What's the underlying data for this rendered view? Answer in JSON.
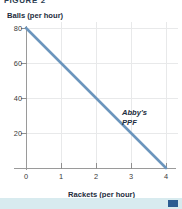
{
  "figure": {
    "caption": "FIGURE 2"
  },
  "axes": {
    "y_title": "Balls (per hour)",
    "x_title": "Rackets (per hour)"
  },
  "annotation": {
    "line1": "Abby's",
    "line2": "PPF"
  },
  "colors": {
    "ppf_line": "#6b95bd",
    "axis": "#9a9a9a",
    "gridline": "#e8e9ea",
    "text": "#1d2d40",
    "band": "#d8ebef",
    "marker": "#2b5c91"
  },
  "chart_data": {
    "type": "line",
    "title": "FIGURE 2",
    "xlabel": "Rackets (per hour)",
    "ylabel": "Balls (per hour)",
    "xlim": [
      0,
      4
    ],
    "ylim": [
      0,
      80
    ],
    "xticks": [
      0,
      1,
      2,
      3,
      4
    ],
    "xticklabels": [
      "0",
      "1",
      "2",
      "3",
      "4"
    ],
    "yticks": [
      0,
      20,
      40,
      60,
      80
    ],
    "yticklabels": [
      "0",
      "20",
      "40",
      "60",
      "80"
    ],
    "grid": true,
    "legend": false,
    "annotations": [
      {
        "text": "Abby's PPF",
        "x": 3.1,
        "y": 26,
        "style": "bold-italic"
      }
    ],
    "series": [
      {
        "name": "Abby's PPF",
        "color": "#6b95bd",
        "x": [
          0,
          1,
          2,
          3,
          4
        ],
        "y": [
          80,
          60,
          40,
          20,
          0
        ]
      }
    ]
  }
}
